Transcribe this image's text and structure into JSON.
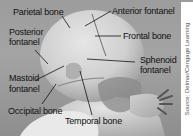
{
  "figure": {
    "labels": {
      "parietal_bone": "Parietal bone",
      "anterior_fontanel": "Anterior fontanel",
      "posterior_fontanel_line1": "Posterior",
      "posterior_fontanel_line2": "fontanel",
      "frontal_bone": "Frontal bone",
      "sphenoid_fontanel_line1": "Sphenoid",
      "sphenoid_fontanel_line2": "fontanel",
      "mastoid_fontanel_line1": "Mastoid",
      "mastoid_fontanel_line2": "fontanel",
      "occipital_bone": "Occipital bone",
      "temporal_bone": "Temporal bone"
    },
    "credit": "Source: Delmar/Cengage Learning",
    "colors": {
      "background": "#a0a0a0",
      "skin_light": "#d8d8d8",
      "skin_mid": "#bcbcbc",
      "shadow": "#6a6a6a",
      "leader_line": "#111111",
      "text": "#111111"
    }
  }
}
